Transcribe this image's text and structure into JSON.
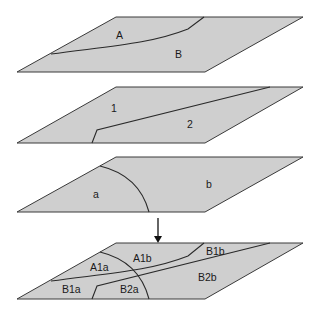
{
  "diagram": {
    "type": "layer-overlay",
    "colors": {
      "plane_fill": "#cfcfcf",
      "stroke": "#2a2a2a",
      "background": "#ffffff"
    },
    "layers": [
      {
        "id": "layer-1",
        "regions": [
          {
            "label": "A"
          },
          {
            "label": "B"
          }
        ]
      },
      {
        "id": "layer-2",
        "regions": [
          {
            "label": "1"
          },
          {
            "label": "2"
          }
        ]
      },
      {
        "id": "layer-3",
        "regions": [
          {
            "label": "a"
          },
          {
            "label": "b"
          }
        ]
      }
    ],
    "arrow": {
      "direction": "down"
    },
    "result": {
      "id": "overlay-result",
      "regions": [
        {
          "label": "A1a"
        },
        {
          "label": "A1b"
        },
        {
          "label": "B1b"
        },
        {
          "label": "B1a"
        },
        {
          "label": "B2a"
        },
        {
          "label": "B2b"
        }
      ]
    }
  }
}
